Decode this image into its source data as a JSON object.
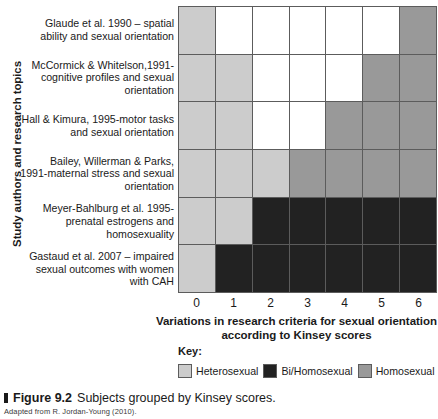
{
  "figure": {
    "marker": "▮",
    "number": "Figure 9.2",
    "title": "Subjects grouped by Kinsey scores.",
    "source_note": "Adapted from R. Jordan-Young (2010)."
  },
  "key": {
    "heading": "Key:",
    "items": [
      {
        "label": "Heterosexual",
        "color": "#cccccc"
      },
      {
        "label": "Bi/Homosexual",
        "color": "#222222"
      },
      {
        "label": "Homosexual",
        "color": "#999999"
      }
    ]
  },
  "colors": {
    "heterosexual": "#cccccc",
    "bi_homosexual": "#222222",
    "homosexual": "#999999",
    "none": "#ffffff",
    "gridline": "#5c5c5c"
  },
  "chart_data": {
    "type": "heatmap",
    "title": "Subjects grouped by Kinsey scores.",
    "xlabel": "Variations in research criteria for sexual orientation according to Kinsey scores",
    "ylabel": "Study authors and research topics",
    "x": [
      "0",
      "1",
      "2",
      "3",
      "4",
      "5",
      "6"
    ],
    "xlim": [
      0,
      6
    ],
    "grid": true,
    "legend_position": "bottom",
    "categories": [
      "Heterosexual",
      "Bi/Homosexual",
      "Homosexual",
      "none"
    ],
    "rows": [
      {
        "label": "Glaude et al. 1990 – spatial ability and sexual orientation",
        "cells": [
          "heterosexual",
          "none",
          "none",
          "none",
          "none",
          "none",
          "homosexual"
        ]
      },
      {
        "label": "McCormick & Whitelson,1991-cognitive profiles and sexual orientation",
        "cells": [
          "heterosexual",
          "heterosexual",
          "none",
          "none",
          "none",
          "homosexual",
          "homosexual"
        ]
      },
      {
        "label": "Hall & Kimura, 1995-motor tasks and sexual orientation",
        "cells": [
          "heterosexual",
          "heterosexual",
          "none",
          "none",
          "homosexual",
          "homosexual",
          "homosexual"
        ]
      },
      {
        "label": "Bailey, Willerman & Parks, 1991-maternal stress and sexual orientation",
        "cells": [
          "heterosexual",
          "heterosexual",
          "heterosexual",
          "homosexual",
          "homosexual",
          "homosexual",
          "homosexual"
        ]
      },
      {
        "label": "Meyer-Bahlburg et al. 1995-prenatal estrogens and homosexuality",
        "cells": [
          "heterosexual",
          "heterosexual",
          "bi_homosexual",
          "bi_homosexual",
          "bi_homosexual",
          "bi_homosexual",
          "bi_homosexual"
        ]
      },
      {
        "label": "Gastaud et al. 2007 – impaired sexual outcomes with women with CAH",
        "cells": [
          "heterosexual",
          "bi_homosexual",
          "bi_homosexual",
          "bi_homosexual",
          "bi_homosexual",
          "bi_homosexual",
          "bi_homosexual"
        ]
      }
    ]
  }
}
